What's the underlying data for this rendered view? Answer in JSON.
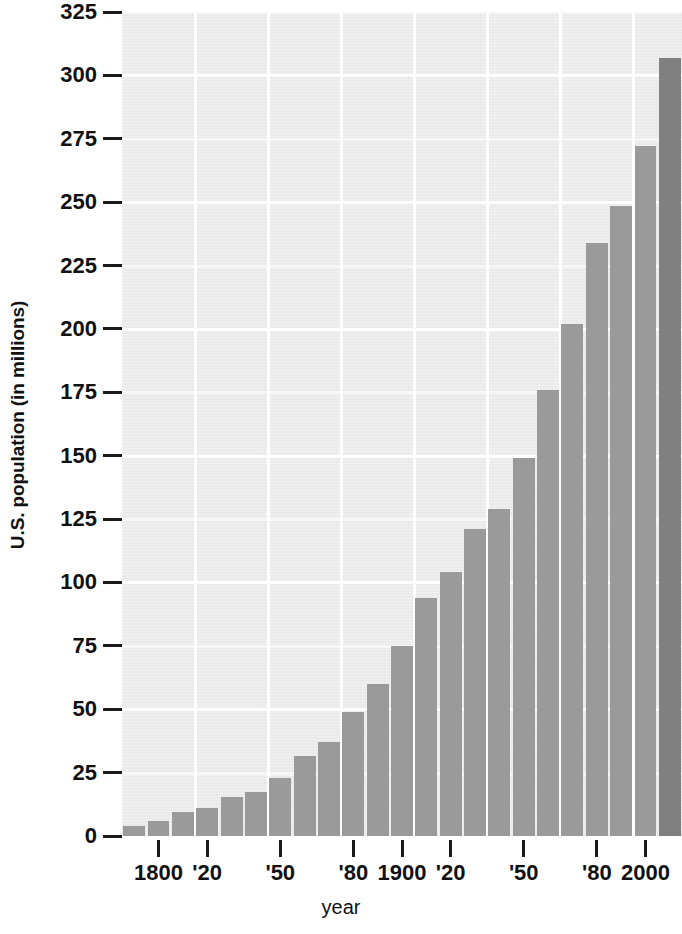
{
  "chart_data": {
    "type": "bar",
    "title": "",
    "subtitle": "",
    "xlabel": "year",
    "ylabel": "U.S. population (in millions)",
    "ylim": [
      0,
      325
    ],
    "yticks": [
      325,
      300,
      275,
      250,
      225,
      200,
      175,
      150,
      125,
      100,
      75,
      50,
      25,
      0
    ],
    "ytick_labels": [
      "325",
      "300",
      "275",
      "250",
      "225",
      "200",
      "175",
      "150",
      "125",
      "100",
      "75",
      "50",
      "25",
      "0"
    ],
    "xtick_labels": [
      "1800",
      "'20",
      "'50",
      "'80",
      "1900",
      "'20",
      "'50",
      "'80",
      "2000"
    ],
    "xtick_years": [
      1800,
      1820,
      1850,
      1880,
      1900,
      1920,
      1950,
      1980,
      2000
    ],
    "grid": "white gridlines, horizontal at every 25 units with emphasis, vertical every 30 years",
    "legend": "none",
    "bar_color": "#9a9a9a",
    "highlight_bar_color": "#808080",
    "plot_background": "#e9e9e9",
    "categories": [
      1790,
      1800,
      1810,
      1820,
      1830,
      1840,
      1850,
      1860,
      1870,
      1880,
      1890,
      1900,
      1910,
      1920,
      1930,
      1940,
      1950,
      1960,
      1970,
      1980,
      1990,
      2000,
      2010
    ],
    "values": [
      4,
      6,
      9.5,
      11,
      15.5,
      17.5,
      23,
      31.5,
      37,
      49,
      60,
      75,
      94,
      104,
      121,
      129,
      149,
      176,
      202,
      234,
      248.5,
      272,
      307
    ],
    "highlight_index": 22
  }
}
